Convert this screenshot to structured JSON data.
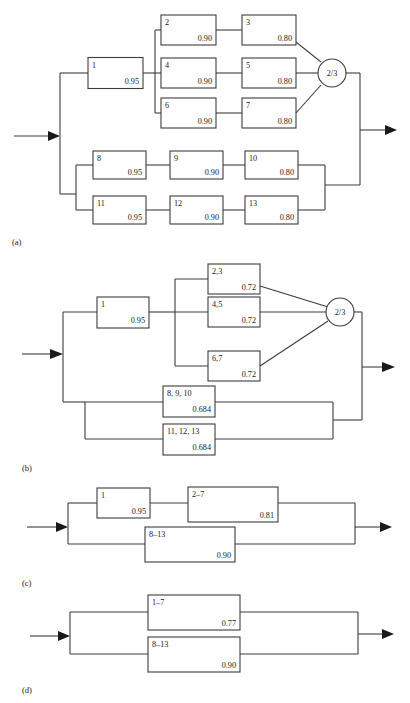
{
  "figure": {
    "kind": "reliability-block-diagram-series",
    "panels": [
      {
        "label": "(a)",
        "blocks": [
          {
            "id": "1",
            "value": "0.95"
          },
          {
            "id": "2",
            "value": "0.90"
          },
          {
            "id": "3",
            "value": "0.80"
          },
          {
            "id": "4",
            "value": "0.90"
          },
          {
            "id": "5",
            "value": "0.80"
          },
          {
            "id": "6",
            "value": "0.90"
          },
          {
            "id": "7",
            "value": "0.80"
          },
          {
            "id": "8",
            "value": "0.95"
          },
          {
            "id": "9",
            "value": "0.90"
          },
          {
            "id": "10",
            "value": "0.80"
          },
          {
            "id": "11",
            "value": "0.95"
          },
          {
            "id": "12",
            "value": "0.90"
          },
          {
            "id": "13",
            "value": "0.80"
          }
        ],
        "node": "2/3"
      },
      {
        "label": "(b)",
        "blocks": [
          {
            "id": "1",
            "value": "0.95"
          },
          {
            "id": "2,3",
            "value": "0.72"
          },
          {
            "id": "4,5",
            "value": "0.72"
          },
          {
            "id": "6,7",
            "value": "0.72"
          },
          {
            "id": "8, 9, 10",
            "value": "0.684"
          },
          {
            "id": "11, 12, 13",
            "value": "0.684"
          }
        ],
        "node": "2/3"
      },
      {
        "label": "(c)",
        "blocks": [
          {
            "id": "1",
            "value": "0.95"
          },
          {
            "id": "2–7",
            "value": "0.81"
          },
          {
            "id": "8–13",
            "value": "0.90"
          }
        ]
      },
      {
        "label": "(d)",
        "blocks": [
          {
            "id": "1–7",
            "value": "0.77"
          },
          {
            "id": "8–13",
            "value": "0.90"
          }
        ]
      }
    ]
  }
}
